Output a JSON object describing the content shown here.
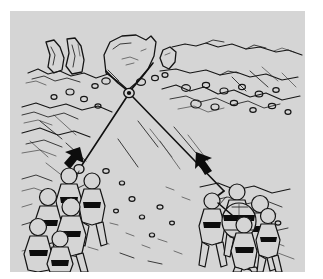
{
  "figure": {
    "background_color": "#d5d5d5",
    "margin_color": "#ffffff",
    "ink_color": "#141414",
    "width": 323,
    "height": 279
  },
  "scene": {
    "anchor": {
      "name": "boulder-anchor",
      "label": "rock anchor with sling",
      "carabiner_label": "master-point carabiner"
    },
    "left_team": {
      "name": "left-rescue-team",
      "label": "rescue party hauling left",
      "member_count": 6,
      "arrow_direction": "down-left"
    },
    "right_team": {
      "name": "right-rescue-team",
      "label": "rescue party with litter hauling right",
      "member_count": 5,
      "arrow_direction": "up-left"
    },
    "ropes": [
      {
        "name": "left-rope-leg",
        "label": "rope leg to left team"
      },
      {
        "name": "right-rope-leg",
        "label": "rope leg to right team"
      }
    ],
    "terrain": {
      "name": "scree-slope",
      "label": "rocky scree slope with boulders and pinnacles"
    }
  }
}
